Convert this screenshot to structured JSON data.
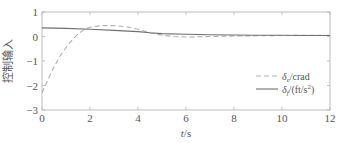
{
  "chart_data": {
    "type": "line",
    "title": "",
    "xlabel": "t/s",
    "ylabel": "控制输入",
    "xlim": [
      0,
      12
    ],
    "ylim": [
      -3,
      1
    ],
    "xticks": [
      0,
      2,
      4,
      6,
      8,
      10,
      12
    ],
    "yticks": [
      1,
      0,
      -1,
      -2,
      -3
    ],
    "xtick_labels": [
      "0",
      "2",
      "4",
      "6",
      "8",
      "10",
      "12"
    ],
    "ytick_labels": [
      "1",
      "0",
      "−1",
      "−2",
      "−3"
    ],
    "grid": false,
    "legend_position": "lower right",
    "series": [
      {
        "name": "δe/crad",
        "style": "dashed",
        "color": "#b0b0b0",
        "x": [
          0,
          0.25,
          0.5,
          0.75,
          1.0,
          1.25,
          1.5,
          1.75,
          2.0,
          2.5,
          3.0,
          3.5,
          4.0,
          4.5,
          5.0,
          5.5,
          6.0,
          7.0,
          8.0,
          9.0,
          10.0,
          11.0,
          12.0
        ],
        "values": [
          -2.3,
          -1.75,
          -1.25,
          -0.8,
          -0.45,
          -0.15,
          0.1,
          0.28,
          0.38,
          0.45,
          0.44,
          0.4,
          0.3,
          0.15,
          0.05,
          0.0,
          -0.02,
          0.0,
          0.02,
          0.03,
          0.04,
          0.05,
          0.05
        ]
      },
      {
        "name": "δf/(ft/s²)",
        "style": "solid",
        "color": "#707070",
        "x": [
          0,
          1,
          2,
          3,
          4,
          4.5,
          5,
          6,
          7,
          8,
          9,
          10,
          11,
          12
        ],
        "values": [
          0.35,
          0.33,
          0.3,
          0.25,
          0.2,
          0.15,
          0.12,
          0.09,
          0.07,
          0.06,
          0.05,
          0.05,
          0.04,
          0.04
        ]
      }
    ]
  },
  "legend": {
    "items": [
      {
        "symbol": "δ",
        "sub": "e",
        "suffix": "/crad"
      },
      {
        "symbol": "δ",
        "sub": "f",
        "suffix": "/(ft/s",
        "sup": "2",
        "close": ")"
      }
    ]
  },
  "axes": {
    "xlabel_italic": "t",
    "xlabel_unit": "/s",
    "ylabel": "控制输入"
  }
}
